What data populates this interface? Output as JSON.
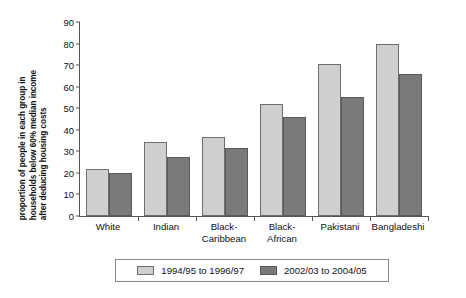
{
  "chart_data": {
    "type": "bar",
    "title": "",
    "subtitle": "",
    "xlabel": "",
    "ylabel": "proportion of people in each group in households below 60% median income after deducing housing costs",
    "ylabel_lines": [
      "proportion of people in each group in",
      "households below 60% median income",
      "after deducing housing costs"
    ],
    "categories": [
      "White",
      "Black-Caribbean",
      "Black-African",
      "Pakistani",
      "Bangladeshi",
      "Indian"
    ],
    "category_lines": [
      [
        "White"
      ],
      [
        "Indian"
      ],
      [
        "Black-",
        "Caribbean"
      ],
      [
        "Black-",
        "African"
      ],
      [
        "Pakistani"
      ],
      [
        "Bangladeshi"
      ]
    ],
    "series": [
      {
        "name": "1994/95 to 1996/97",
        "color": "#cfcfcf",
        "values": [
          22,
          34.5,
          36.5,
          52,
          70.5,
          80
        ]
      },
      {
        "name": "2002/03 to 2004/05",
        "color": "#7a7a7a",
        "values": [
          20,
          27.5,
          31.5,
          46,
          55,
          66
        ]
      }
    ],
    "ylim": [
      0,
      90
    ],
    "y_ticks": [
      0,
      10,
      20,
      30,
      40,
      50,
      60,
      70,
      80,
      90
    ],
    "grid": false,
    "legend_position": "bottom"
  },
  "legend": {
    "items": [
      {
        "label": "1994/95 to 1996/97"
      },
      {
        "label": "2002/03 to 2004/05"
      }
    ]
  }
}
